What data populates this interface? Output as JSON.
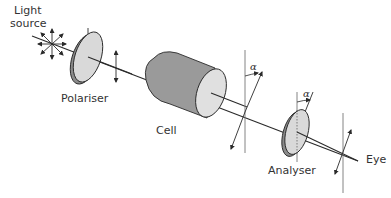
{
  "diagram": {
    "type": "polarimeter schematic",
    "labels": {
      "light_source_line1": "Light",
      "light_source_line2": "source",
      "polariser": "Polariser",
      "cell": "Cell",
      "analyser": "Analyser",
      "eye": "Eye",
      "angle_symbol_1": "α",
      "angle_symbol_2": "α"
    },
    "components": [
      {
        "id": "light-source",
        "label": "Light source"
      },
      {
        "id": "polariser",
        "label": "Polariser"
      },
      {
        "id": "cell",
        "label": "Cell"
      },
      {
        "id": "analyser",
        "label": "Analyser"
      },
      {
        "id": "eye",
        "label": "Eye"
      }
    ],
    "colors": {
      "line": "#2a2a2a",
      "disc_face": "#d9d9d9",
      "disc_edge": "#8a8a8a",
      "cell_body": "#9a9a9a",
      "cell_end": "#e0e0e0",
      "guide_line": "#777777"
    }
  }
}
